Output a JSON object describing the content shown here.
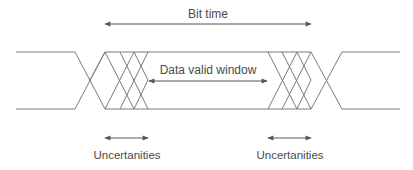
{
  "diagram": {
    "labels": {
      "bit_time": "Bit time",
      "data_valid_window": "Data valid window",
      "uncertainty_left": "Uncertanities",
      "uncertainty_right": "Uncertanities"
    },
    "colors": {
      "line": "#7a7a7a",
      "arrow": "#555555",
      "text": "#4a4a4a",
      "background": "#ffffff"
    }
  }
}
